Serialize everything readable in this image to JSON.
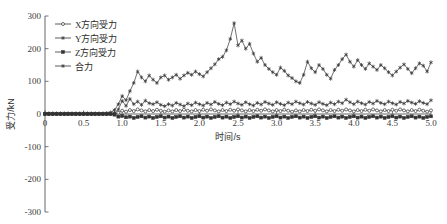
{
  "chart_data": {
    "type": "line",
    "title": "",
    "xlabel": "时间/s",
    "ylabel": "受力/kN",
    "xlim": [
      0,
      5.0
    ],
    "ylim": [
      -300,
      300
    ],
    "xticks": [
      "0",
      "0.5",
      "1.0",
      "1.5",
      "2.0",
      "2.5",
      "3.0",
      "3.5",
      "4.0",
      "4.5",
      "5.0"
    ],
    "xtick_values": [
      0,
      0.5,
      1.0,
      1.5,
      2.0,
      2.5,
      3.0,
      3.5,
      4.0,
      4.5,
      5.0
    ],
    "yticks": [
      "300",
      "200",
      "100",
      "0",
      "-100",
      "-200",
      "-300"
    ],
    "ytick_values": [
      300,
      200,
      100,
      0,
      -100,
      -200,
      -300
    ],
    "grid": false,
    "legend_position": "top-left",
    "line_color": "#333333",
    "axis_color": "#555555",
    "series": [
      {
        "name": "X方向受力",
        "marker": "circle",
        "x": [
          0.0,
          0.05,
          0.1,
          0.15,
          0.2,
          0.25,
          0.3,
          0.35,
          0.4,
          0.45,
          0.5,
          0.55,
          0.6,
          0.65,
          0.7,
          0.75,
          0.8,
          0.85,
          0.9,
          0.95,
          1.0,
          1.05,
          1.1,
          1.15,
          1.2,
          1.25,
          1.3,
          1.35,
          1.4,
          1.45,
          1.5,
          1.55,
          1.6,
          1.65,
          1.7,
          1.75,
          1.8,
          1.85,
          1.9,
          1.95,
          2.0,
          2.05,
          2.1,
          2.15,
          2.2,
          2.25,
          2.3,
          2.35,
          2.4,
          2.45,
          2.5,
          2.55,
          2.6,
          2.65,
          2.7,
          2.75,
          2.8,
          2.85,
          2.9,
          2.95,
          3.0,
          3.05,
          3.1,
          3.15,
          3.2,
          3.25,
          3.3,
          3.35,
          3.4,
          3.45,
          3.5,
          3.55,
          3.6,
          3.65,
          3.7,
          3.75,
          3.8,
          3.85,
          3.9,
          3.95,
          4.0,
          4.05,
          4.1,
          4.15,
          4.2,
          4.25,
          4.3,
          4.35,
          4.4,
          4.45,
          4.5,
          4.55,
          4.6,
          4.65,
          4.7,
          4.75,
          4.8,
          4.85,
          4.9,
          4.95,
          5.0
        ],
        "values": [
          0,
          0,
          0,
          0,
          0,
          0,
          0,
          0,
          0,
          0,
          0,
          0,
          0,
          0,
          0,
          0,
          0,
          0,
          1,
          4,
          10,
          7,
          12,
          9,
          14,
          11,
          8,
          12,
          9,
          13,
          10,
          7,
          11,
          8,
          12,
          9,
          13,
          10,
          8,
          12,
          9,
          13,
          10,
          14,
          11,
          8,
          12,
          9,
          13,
          10,
          14,
          11,
          8,
          12,
          9,
          13,
          10,
          14,
          11,
          8,
          12,
          9,
          13,
          10,
          7,
          11,
          8,
          12,
          9,
          13,
          10,
          14,
          11,
          8,
          12,
          9,
          13,
          10,
          14,
          11,
          8,
          12,
          9,
          13,
          10,
          14,
          11,
          8,
          12,
          9,
          13,
          10,
          14,
          11,
          8,
          12,
          9,
          13,
          10,
          7,
          11
        ]
      },
      {
        "name": "Y方向受力",
        "marker": "star",
        "x": [
          0.0,
          0.05,
          0.1,
          0.15,
          0.2,
          0.25,
          0.3,
          0.35,
          0.4,
          0.45,
          0.5,
          0.55,
          0.6,
          0.65,
          0.7,
          0.75,
          0.8,
          0.85,
          0.9,
          0.95,
          1.0,
          1.05,
          1.1,
          1.15,
          1.2,
          1.25,
          1.3,
          1.35,
          1.4,
          1.45,
          1.5,
          1.55,
          1.6,
          1.65,
          1.7,
          1.75,
          1.8,
          1.85,
          1.9,
          1.95,
          2.0,
          2.05,
          2.1,
          2.15,
          2.2,
          2.25,
          2.3,
          2.35,
          2.4,
          2.45,
          2.5,
          2.55,
          2.6,
          2.65,
          2.7,
          2.75,
          2.8,
          2.85,
          2.9,
          2.95,
          3.0,
          3.05,
          3.1,
          3.15,
          3.2,
          3.25,
          3.3,
          3.35,
          3.4,
          3.45,
          3.5,
          3.55,
          3.6,
          3.65,
          3.7,
          3.75,
          3.8,
          3.85,
          3.9,
          3.95,
          4.0,
          4.05,
          4.1,
          4.15,
          4.2,
          4.25,
          4.3,
          4.35,
          4.4,
          4.45,
          4.5,
          4.55,
          4.6,
          4.65,
          4.7,
          4.75,
          4.8,
          4.85,
          4.9,
          4.95,
          5.0
        ],
        "values": [
          0,
          0,
          0,
          0,
          0,
          0,
          0,
          0,
          0,
          0,
          0,
          0,
          0,
          0,
          0,
          0,
          0,
          0,
          3,
          14,
          40,
          25,
          46,
          30,
          38,
          28,
          41,
          33,
          30,
          36,
          28,
          24,
          30,
          26,
          34,
          29,
          24,
          32,
          27,
          35,
          30,
          26,
          34,
          29,
          37,
          31,
          27,
          35,
          30,
          38,
          32,
          28,
          36,
          30,
          26,
          34,
          29,
          37,
          32,
          28,
          36,
          31,
          27,
          35,
          30,
          38,
          33,
          29,
          37,
          32,
          28,
          36,
          31,
          27,
          35,
          30,
          38,
          33,
          44,
          36,
          30,
          38,
          33,
          29,
          37,
          32,
          40,
          34,
          30,
          38,
          33,
          29,
          37,
          32,
          40,
          35,
          31,
          39,
          34,
          30,
          42
        ]
      },
      {
        "name": "Z方向受力",
        "marker": "square",
        "x": [
          0.0,
          0.05,
          0.1,
          0.15,
          0.2,
          0.25,
          0.3,
          0.35,
          0.4,
          0.45,
          0.5,
          0.55,
          0.6,
          0.65,
          0.7,
          0.75,
          0.8,
          0.85,
          0.9,
          0.95,
          1.0,
          1.05,
          1.1,
          1.15,
          1.2,
          1.25,
          1.3,
          1.35,
          1.4,
          1.45,
          1.5,
          1.55,
          1.6,
          1.65,
          1.7,
          1.75,
          1.8,
          1.85,
          1.9,
          1.95,
          2.0,
          2.05,
          2.1,
          2.15,
          2.2,
          2.25,
          2.3,
          2.35,
          2.4,
          2.45,
          2.5,
          2.55,
          2.6,
          2.65,
          2.7,
          2.75,
          2.8,
          2.85,
          2.9,
          2.95,
          3.0,
          3.05,
          3.1,
          3.15,
          3.2,
          3.25,
          3.3,
          3.35,
          3.4,
          3.45,
          3.5,
          3.55,
          3.6,
          3.65,
          3.7,
          3.75,
          3.8,
          3.85,
          3.9,
          3.95,
          4.0,
          4.05,
          4.1,
          4.15,
          4.2,
          4.25,
          4.3,
          4.35,
          4.4,
          4.45,
          4.5,
          4.55,
          4.6,
          4.65,
          4.7,
          4.75,
          4.8,
          4.85,
          4.9,
          4.95,
          5.0
        ],
        "values": [
          0,
          0,
          0,
          0,
          0,
          0,
          0,
          0,
          0,
          0,
          0,
          0,
          0,
          0,
          0,
          0,
          0,
          0,
          -2,
          -8,
          -6,
          -10,
          -8,
          -12,
          -9,
          -7,
          -11,
          -8,
          -12,
          -9,
          -7,
          -11,
          -8,
          -12,
          -9,
          -7,
          -11,
          -8,
          -12,
          -9,
          -7,
          -11,
          -8,
          -12,
          -9,
          -7,
          -11,
          -8,
          -12,
          -9,
          -7,
          -11,
          -8,
          -12,
          -9,
          -7,
          -11,
          -8,
          -12,
          -9,
          -7,
          -11,
          -8,
          -12,
          -9,
          -7,
          -11,
          -8,
          -12,
          -9,
          -7,
          -11,
          -8,
          -12,
          -9,
          -7,
          -11,
          -8,
          -12,
          -9,
          -7,
          -11,
          -8,
          -12,
          -9,
          -7,
          -11,
          -8,
          -12,
          -9,
          -7,
          -11,
          -8,
          -12,
          -9,
          -7,
          -11,
          -8,
          -12,
          -9,
          -7
        ]
      },
      {
        "name": "合力",
        "marker": "filled-star",
        "x": [
          0.0,
          0.05,
          0.1,
          0.15,
          0.2,
          0.25,
          0.3,
          0.35,
          0.4,
          0.45,
          0.5,
          0.55,
          0.6,
          0.65,
          0.7,
          0.75,
          0.8,
          0.85,
          0.9,
          0.95,
          1.0,
          1.05,
          1.1,
          1.15,
          1.2,
          1.25,
          1.3,
          1.35,
          1.4,
          1.45,
          1.5,
          1.55,
          1.6,
          1.65,
          1.7,
          1.75,
          1.8,
          1.85,
          1.9,
          1.95,
          2.0,
          2.05,
          2.1,
          2.15,
          2.2,
          2.25,
          2.3,
          2.35,
          2.4,
          2.45,
          2.5,
          2.55,
          2.6,
          2.65,
          2.7,
          2.75,
          2.8,
          2.85,
          2.9,
          2.95,
          3.0,
          3.05,
          3.1,
          3.15,
          3.2,
          3.25,
          3.3,
          3.35,
          3.4,
          3.45,
          3.5,
          3.55,
          3.6,
          3.65,
          3.7,
          3.75,
          3.8,
          3.85,
          3.9,
          3.95,
          4.0,
          4.05,
          4.1,
          4.15,
          4.2,
          4.25,
          4.3,
          4.35,
          4.4,
          4.45,
          4.5,
          4.55,
          4.6,
          4.65,
          4.7,
          4.75,
          4.8,
          4.85,
          4.9,
          4.95,
          5.0
        ],
        "values": [
          2,
          2,
          2,
          2,
          2,
          2,
          2,
          2,
          2,
          2,
          2,
          2,
          2,
          2,
          2,
          2,
          3,
          5,
          12,
          30,
          55,
          42,
          70,
          95,
          130,
          112,
          100,
          118,
          105,
          95,
          112,
          118,
          105,
          112,
          120,
          108,
          118,
          126,
          120,
          130,
          122,
          115,
          128,
          140,
          152,
          168,
          175,
          195,
          230,
          278,
          210,
          225,
          200,
          215,
          185,
          160,
          172,
          150,
          138,
          128,
          120,
          142,
          132,
          118,
          110,
          100,
          95,
          120,
          160,
          140,
          128,
          150,
          138,
          120,
          108,
          135,
          150,
          168,
          182,
          160,
          145,
          165,
          150,
          138,
          155,
          145,
          135,
          150,
          140,
          128,
          118,
          130,
          142,
          152,
          138,
          125,
          140,
          155,
          148,
          130,
          158
        ]
      }
    ]
  },
  "legend": {
    "items": [
      {
        "label": "X方向受力",
        "marker": "circle"
      },
      {
        "label": "Y方向受力",
        "marker": "star"
      },
      {
        "label": "Z方向受力",
        "marker": "square"
      },
      {
        "label": "合力",
        "marker": "filled-star"
      }
    ]
  }
}
